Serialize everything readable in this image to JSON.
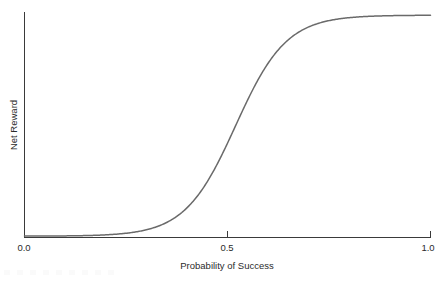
{
  "chart_data": {
    "type": "line",
    "title": "",
    "xlabel": "Probability of Success",
    "ylabel": "Net Reward",
    "xlim": [
      0.0,
      1.0
    ],
    "ylim": [
      0.0,
      1.0
    ],
    "grid": false,
    "legend": "none",
    "x_tick_labels": [
      "0.0",
      "0.5",
      "1.0"
    ],
    "x_tick_values": [
      0.0,
      0.5,
      1.0
    ],
    "y_tick_labels": [],
    "y_tick_values": [],
    "curve_description": "Logistic sigmoid of net reward rising from near zero at low probability of success to a high plateau above probability 0.7, with steepest slope near 0.52",
    "series": [
      {
        "name": "Net Reward",
        "color": "#6a6a6a",
        "midpoint": 0.52,
        "steepness": 16,
        "x": [
          0.0,
          0.05,
          0.1,
          0.15,
          0.2,
          0.25,
          0.3,
          0.35,
          0.4,
          0.42,
          0.45,
          0.47,
          0.5,
          0.52,
          0.55,
          0.57,
          0.6,
          0.63,
          0.66,
          0.7,
          0.75,
          0.8,
          0.85,
          0.9,
          0.95,
          1.0
        ],
        "values": [
          0.004,
          0.005,
          0.008,
          0.013,
          0.021,
          0.033,
          0.052,
          0.08,
          0.121,
          0.146,
          0.196,
          0.24,
          0.317,
          0.372,
          0.474,
          0.545,
          0.647,
          0.74,
          0.814,
          0.884,
          0.938,
          0.962,
          0.974,
          0.982,
          0.988,
          0.992
        ]
      }
    ]
  },
  "axes": {
    "x_axis_name": "probability-of-success-axis",
    "y_axis_name": "net-reward-axis"
  },
  "colors": {
    "curve": "#6a6a6a",
    "axis": "#3a3a3a",
    "text": "#2b2b2b",
    "background": "#ffffff"
  }
}
